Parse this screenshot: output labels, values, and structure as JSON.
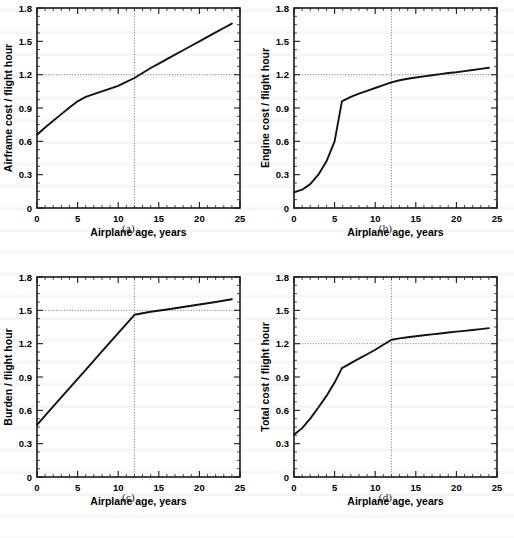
{
  "figure": {
    "width": 514,
    "height": 538,
    "background": "#ffffff",
    "line_color": "#111111",
    "refline_color": "#55504e"
  },
  "panels": [
    {
      "caption": "(a)",
      "key": "a"
    },
    {
      "caption": "(b)",
      "key": "b"
    },
    {
      "caption": "(c)",
      "key": "c"
    },
    {
      "caption": "(d)",
      "key": "d"
    }
  ],
  "chart_data": [
    {
      "type": "line",
      "panel": "(a)",
      "title": "",
      "xlabel": "Airplane age, years",
      "ylabel": "Airframe cost / flight hour",
      "xlim": [
        0,
        25
      ],
      "ylim": [
        0,
        1.8
      ],
      "xticks": [
        0,
        5,
        10,
        15,
        20,
        25
      ],
      "xticklabels": [
        "0",
        "5",
        "10",
        "15",
        "20",
        "25"
      ],
      "yticks": [
        0,
        0.3,
        0.6,
        0.9,
        1.2,
        1.5,
        1.8
      ],
      "yticklabels": [
        "0",
        "0.3",
        "0.6",
        "0.9",
        "1.2",
        "1.5",
        "1.8"
      ],
      "x_minor_step": 1,
      "y_minor_step": 0.075,
      "grid": false,
      "legend": null,
      "reference_lines": {
        "horizontal": 1.2,
        "vertical": 12
      },
      "x": [
        0,
        1,
        2,
        3,
        4,
        5,
        6,
        7,
        8,
        9,
        10,
        11,
        12,
        13,
        14,
        15,
        16,
        17,
        18,
        19,
        20,
        21,
        22,
        23,
        24
      ],
      "values": [
        0.66,
        0.725,
        0.785,
        0.845,
        0.905,
        0.96,
        1.0,
        1.025,
        1.05,
        1.075,
        1.1,
        1.135,
        1.17,
        1.215,
        1.26,
        1.3,
        1.34,
        1.38,
        1.42,
        1.46,
        1.5,
        1.54,
        1.58,
        1.62,
        1.66
      ]
    },
    {
      "type": "line",
      "panel": "(b)",
      "title": "",
      "xlabel": "Airplane age, years",
      "ylabel": "Engine cost / flight hour",
      "xlim": [
        0,
        25
      ],
      "ylim": [
        0,
        1.8
      ],
      "xticks": [
        0,
        5,
        10,
        15,
        20,
        25
      ],
      "xticklabels": [
        "0",
        "5",
        "10",
        "15",
        "20",
        "25"
      ],
      "yticks": [
        0,
        0.3,
        0.6,
        0.9,
        1.2,
        1.5,
        1.8
      ],
      "yticklabels": [
        "0",
        "0.3",
        "0.6",
        "0.9",
        "1.2",
        "1.5",
        "1.8"
      ],
      "x_minor_step": 1,
      "y_minor_step": 0.075,
      "grid": false,
      "legend": null,
      "reference_lines": {
        "horizontal": 1.2,
        "vertical": 12
      },
      "x": [
        0,
        1,
        2,
        3,
        4,
        5,
        5.9,
        6,
        7,
        8,
        9,
        10,
        11,
        12,
        13,
        14,
        15,
        16,
        17,
        18,
        19,
        20,
        21,
        22,
        23,
        24
      ],
      "values": [
        0.14,
        0.165,
        0.215,
        0.3,
        0.42,
        0.6,
        0.96,
        0.965,
        1.0,
        1.03,
        1.055,
        1.08,
        1.105,
        1.13,
        1.15,
        1.163,
        1.175,
        1.185,
        1.195,
        1.205,
        1.215,
        1.222,
        1.232,
        1.242,
        1.252,
        1.262
      ]
    },
    {
      "type": "line",
      "panel": "(c)",
      "title": "",
      "xlabel": "Airplane age, years",
      "ylabel": "Burden / flight hour",
      "xlim": [
        0,
        25
      ],
      "ylim": [
        0,
        1.8
      ],
      "xticks": [
        0,
        5,
        10,
        15,
        20,
        25
      ],
      "xticklabels": [
        "0",
        "5",
        "10",
        "15",
        "20",
        "25"
      ],
      "yticks": [
        0,
        0.3,
        0.6,
        0.9,
        1.2,
        1.5,
        1.8
      ],
      "yticklabels": [
        "0",
        "0.3",
        "0.6",
        "0.9",
        "1.2",
        "1.5",
        "1.8"
      ],
      "x_minor_step": 1,
      "y_minor_step": 0.075,
      "grid": false,
      "legend": null,
      "reference_lines": {
        "horizontal": 1.5,
        "vertical": 12
      },
      "x": [
        0,
        2,
        4,
        6,
        8,
        10,
        12,
        14,
        16,
        18,
        20,
        22,
        24
      ],
      "values": [
        0.47,
        0.635,
        0.8,
        0.965,
        1.13,
        1.295,
        1.46,
        1.487,
        1.508,
        1.53,
        1.552,
        1.575,
        1.6
      ]
    },
    {
      "type": "line",
      "panel": "(d)",
      "title": "",
      "xlabel": "Airplane age, years",
      "ylabel": "Total cost / flight hour",
      "xlim": [
        0,
        25
      ],
      "ylim": [
        0,
        1.8
      ],
      "xticks": [
        0,
        5,
        10,
        15,
        20,
        25
      ],
      "xticklabels": [
        "0",
        "5",
        "10",
        "15",
        "20",
        "25"
      ],
      "yticks": [
        0,
        0.3,
        0.6,
        0.9,
        1.2,
        1.5,
        1.8
      ],
      "yticklabels": [
        "0",
        "0.3",
        "0.6",
        "0.9",
        "1.2",
        "1.5",
        "1.8"
      ],
      "x_minor_step": 1,
      "y_minor_step": 0.075,
      "grid": false,
      "legend": null,
      "reference_lines": {
        "horizontal": 1.2,
        "vertical": 12
      },
      "x": [
        0,
        1,
        2,
        3,
        4,
        5,
        5.9,
        7,
        8,
        9,
        10,
        11,
        12,
        13,
        14,
        15,
        16,
        17,
        18,
        19,
        20,
        21,
        22,
        23,
        24
      ],
      "values": [
        0.38,
        0.44,
        0.525,
        0.625,
        0.73,
        0.85,
        0.98,
        1.025,
        1.065,
        1.105,
        1.145,
        1.19,
        1.235,
        1.248,
        1.258,
        1.267,
        1.276,
        1.284,
        1.292,
        1.3,
        1.308,
        1.315,
        1.323,
        1.331,
        1.34
      ]
    }
  ]
}
